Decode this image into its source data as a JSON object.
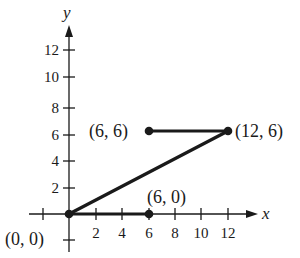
{
  "axes": {
    "x_label": "x",
    "y_label": "y",
    "x_ticks": [
      "2",
      "4",
      "6",
      "8",
      "10",
      "12"
    ],
    "y_ticks": [
      "2",
      "4",
      "6",
      "8",
      "10",
      "12"
    ]
  },
  "points": [
    {
      "label": "(0, 0)",
      "x": 0,
      "y": 0
    },
    {
      "label": "(6, 0)",
      "x": 6,
      "y": 0
    },
    {
      "label": "(6, 6)",
      "x": 6,
      "y": 6
    },
    {
      "label": "(12, 6)",
      "x": 12,
      "y": 6
    }
  ],
  "segments": [
    {
      "from": "(0, 0)",
      "to": "(6, 0)"
    },
    {
      "from": "(0, 0)",
      "to": "(12, 6)"
    },
    {
      "from": "(6, 6)",
      "to": "(12, 6)"
    }
  ],
  "colors": {
    "ink": "#1a1a1a",
    "background": "#ffffff"
  }
}
